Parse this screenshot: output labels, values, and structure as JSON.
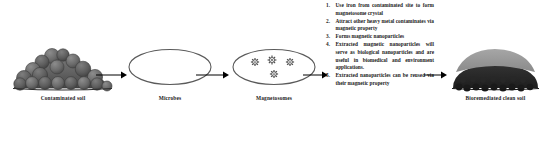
{
  "diagram": {
    "background_color": "#ffffff",
    "stages": [
      {
        "id": "contaminated-soil",
        "label": "Contaminated soil",
        "icon": "soil-mound-icon",
        "colors": {
          "body": "#6f6f6f",
          "shade": "#4b4b4b",
          "outline": "#3a3a3a"
        }
      },
      {
        "id": "microbes",
        "label": "Microbes",
        "icon": "ellipse-cell-icon",
        "colors": {
          "fill": "#ffffff",
          "outline": "#5a5a5a"
        }
      },
      {
        "id": "magnetosomes",
        "label": "Magnetosomes",
        "icon": "ellipse-with-particles-icon",
        "particle_count": 4,
        "colors": {
          "fill": "#ffffff",
          "outline": "#5a5a5a",
          "particle": "#4a4a4a"
        }
      },
      {
        "id": "bioremediated-clean-soil",
        "label": "Bioremediated clean soil",
        "icon": "clean-soil-mound-icon",
        "colors": {
          "top": "#9a9a9a",
          "base": "#2a2a2a"
        }
      }
    ],
    "arrows": [
      {
        "id": "arrow-soil-to-microbes",
        "direction": "right"
      },
      {
        "id": "arrow-microbes-to-magnetosomes",
        "direction": "right"
      },
      {
        "id": "arrow-magnetosomes-to-list",
        "direction": "right"
      },
      {
        "id": "arrow-list-to-clean-soil",
        "direction": "right"
      }
    ],
    "arrow_color": "#000000",
    "instructions": [
      {
        "number": "1.",
        "text": "Use iron from contaminated site to form magnetosome crystal"
      },
      {
        "number": "2.",
        "text": "Attract other heavy metal contaminates via magnetic property"
      },
      {
        "number": "3.",
        "text": "Forms magnetic nanoparticles"
      },
      {
        "number": "4.",
        "text": "Extracted magnetic nanoparticles will serve as biological nanoparticles and are useful in biomedical and environment applications."
      },
      {
        "number": "5.",
        "text": "Extracted nanoparticles can be reused via their magnetic property"
      }
    ]
  }
}
